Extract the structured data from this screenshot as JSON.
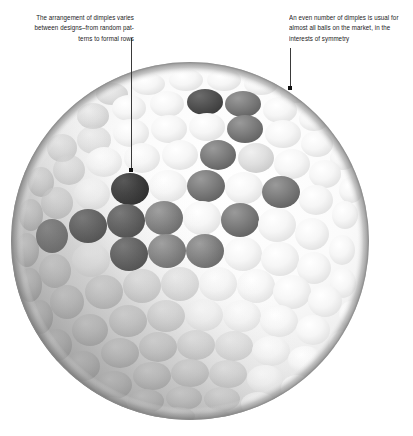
{
  "figure": {
    "background_color": "#ffffff"
  },
  "annotations": {
    "left": {
      "text": "The arrangement of dimples varies between designs–from random pat-\nterns to formal rows",
      "align": "right",
      "leader": {
        "x": 131,
        "y_top": 38,
        "y_bottom": 170,
        "dot_x": 131,
        "dot_y": 170
      }
    },
    "right": {
      "text": "An even number of dimples is usual for almost all balls on the market, in the interests of symmetry",
      "align": "left",
      "leader": {
        "x": 290,
        "y_top": 48,
        "y_bottom": 88,
        "dot_x": 290,
        "dot_y": 88
      }
    }
  },
  "colors": {
    "text": "#1b1b1b",
    "leader_line": "#3a3a3a",
    "leader_dot": "#111111",
    "ball_light": "#fdfdfd",
    "ball_mid": "#b9b9b9",
    "ball_dark": "#4a4a4a",
    "ball_darkest": "#2d2d2d",
    "ball_rim": "#8e8e8e"
  },
  "ball": {
    "center_x": 190,
    "center_y": 241,
    "radius": 179,
    "dimple_rows": 13,
    "dimple_radius_px": 17
  }
}
